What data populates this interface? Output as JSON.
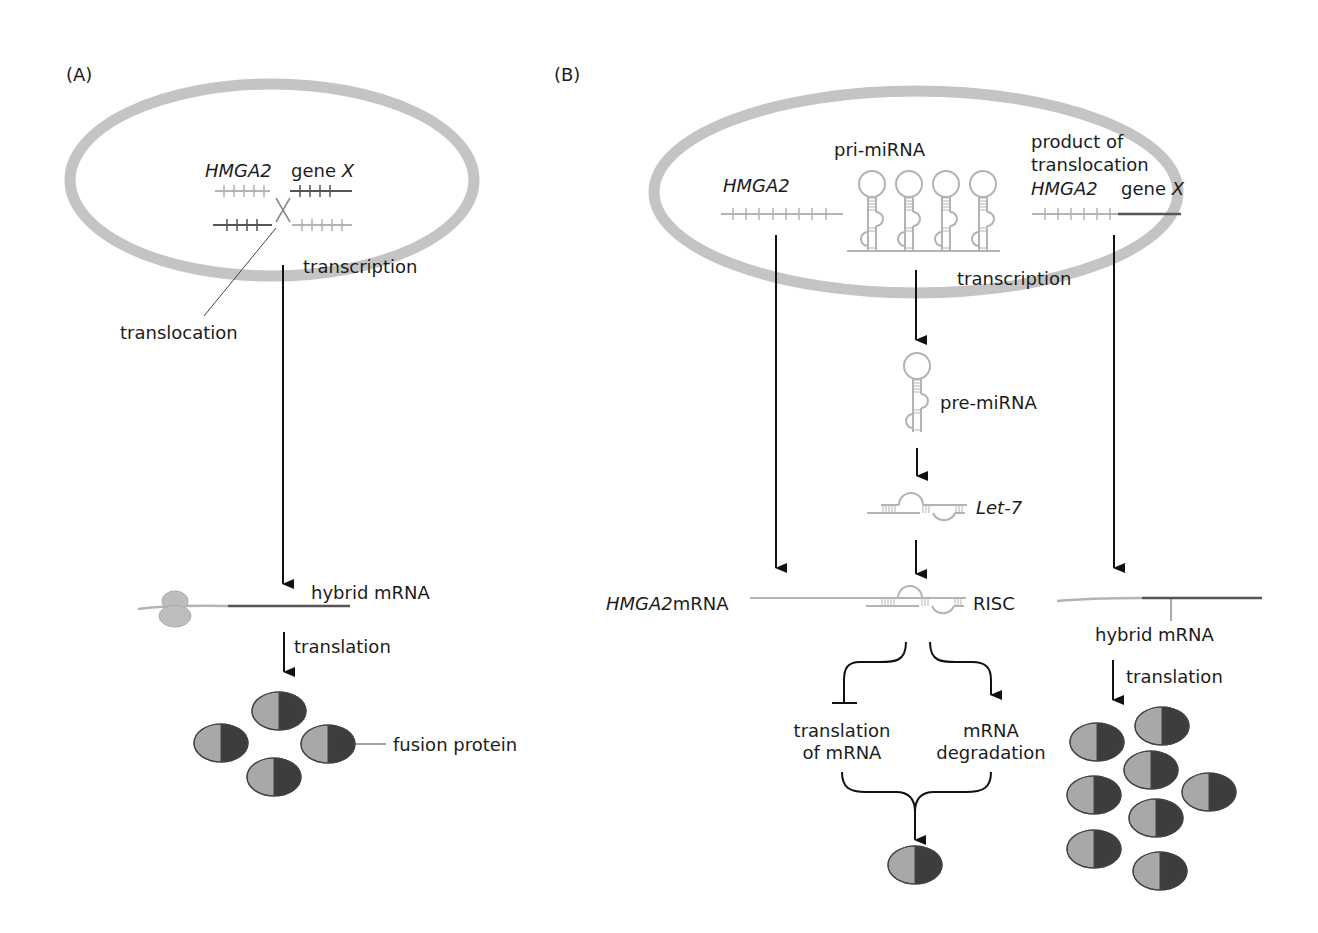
{
  "panels": {
    "A": {
      "label": "(A)",
      "nucleus": {
        "gene_left": "HMGA2",
        "gene_right_prefix": "gene ",
        "gene_right_var": "X"
      },
      "translocation": "translocation",
      "transcription": "transcription",
      "hybrid_mrna": "hybrid mRNA",
      "translation": "translation",
      "fusion_protein": "fusion protein"
    },
    "B": {
      "label": "(B)",
      "nucleus": {
        "gene_hmga2": "HMGA2",
        "pri_mirna": "pri-miRNA",
        "product_line1": "product of",
        "product_line2": "translocation",
        "product_gene_left": "HMGA2",
        "product_gene_right_prefix": "gene ",
        "product_gene_right_var": "X",
        "transcription": "transcription"
      },
      "pre_mirna": "pre-miRNA",
      "let7": "Let-7",
      "hmga2_mrna_italic": "HMGA2",
      "hmga2_mrna_suffix": "mRNA",
      "risc": "RISC",
      "hybrid_mrna": "hybrid mRNA",
      "translation": "translation",
      "outcome_left_line1": "translation",
      "outcome_left_line2": "of mRNA",
      "outcome_right_line1": "mRNA",
      "outcome_right_line2": "degradation"
    }
  },
  "colors": {
    "nucleus_membrane": "#c4c4c4",
    "hmga2_strand": "#b3b3b3",
    "gene_x_strand": "#555555",
    "arrow": "#111111",
    "protein_light": "#a8a8a8",
    "protein_dark": "#3d3d3d",
    "ribosome": "#bdbdbd"
  }
}
